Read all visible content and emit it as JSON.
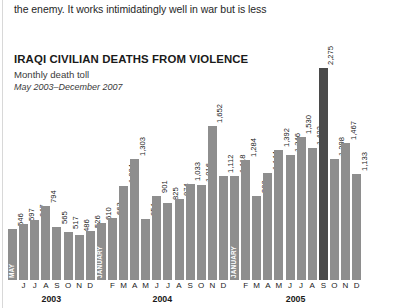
{
  "body_text": "the enemy. It works intimidatingly well in war but is less",
  "figure": {
    "title": "IRAQI CIVILIAN DEATHS FROM VIOLENCE",
    "subtitle": "Monthly death toll",
    "date_range": "May 2003–December 2007",
    "colors": {
      "bar": "#8e8e8e",
      "bar_highlight": "#4a4a4a",
      "text": "#1a1a1a"
    }
  },
  "chart_data": {
    "type": "bar",
    "title": "IRAQI CIVILIAN DEATHS FROM VIOLENCE",
    "subtitle": "Monthly death toll",
    "annotation": "May 2003–December 2007",
    "xlabel": "",
    "ylabel": "Monthly death toll",
    "ylim": [
      0,
      2275
    ],
    "grid": false,
    "legend": null,
    "highlight_index": 28,
    "categories": [
      "MAY",
      "J",
      "J",
      "A",
      "S",
      "O",
      "N",
      "D",
      "JANUARY",
      "F",
      "M",
      "A",
      "M",
      "J",
      "J",
      "A",
      "S",
      "O",
      "N",
      "D",
      "JANUARY",
      "F",
      "M",
      "A",
      "M",
      "J",
      "J",
      "A",
      "S",
      "O",
      "N",
      "D"
    ],
    "value_labels": [
      "546",
      "597",
      "647",
      "794",
      "565",
      "517",
      "486",
      "526",
      "610",
      "663",
      "1,004",
      "1,303",
      "654",
      "901",
      "825",
      "874",
      "1,033",
      "1,016",
      "1,652",
      "1,112",
      "1,118",
      "1,284",
      "902",
      "1,144",
      "1,392",
      "1,346",
      "1,530",
      "1,422",
      "2,275",
      "1,298",
      "1,467",
      "1,133"
    ],
    "values": [
      546,
      597,
      647,
      794,
      565,
      517,
      486,
      526,
      610,
      663,
      1004,
      1303,
      654,
      901,
      825,
      874,
      1033,
      1016,
      1652,
      1112,
      1118,
      1284,
      902,
      1144,
      1392,
      1346,
      1530,
      1422,
      2275,
      1298,
      1467,
      1133
    ],
    "inside_words": [
      "MAY",
      null,
      null,
      null,
      null,
      null,
      null,
      null,
      "JANUARY",
      null,
      null,
      null,
      null,
      null,
      null,
      null,
      null,
      null,
      null,
      null,
      "JANUARY",
      null,
      null,
      null,
      null,
      null,
      null,
      null,
      null,
      null,
      null,
      null
    ],
    "tick_labels": [
      "",
      "J",
      "J",
      "A",
      "S",
      "O",
      "N",
      "D",
      "",
      "F",
      "M",
      "A",
      "M",
      "J",
      "J",
      "A",
      "S",
      "O",
      "N",
      "D",
      "",
      "F",
      "M",
      "A",
      "M",
      "J",
      "J",
      "A",
      "S",
      "O",
      "N",
      "D"
    ],
    "year_groups": [
      {
        "label": "2003",
        "start_index": 0,
        "end_index": 7
      },
      {
        "label": "2004",
        "start_index": 8,
        "end_index": 19
      },
      {
        "label": "2005",
        "start_index": 20,
        "end_index": 31
      }
    ]
  }
}
